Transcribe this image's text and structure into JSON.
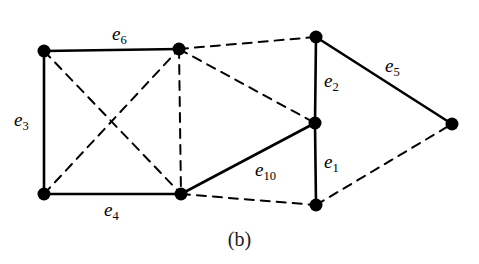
{
  "figure": {
    "caption": "(b)",
    "width": 479,
    "height": 264,
    "background_color": "#ffffff",
    "stroke_color": "#000000",
    "node_color": "#000000"
  },
  "chart_data": {
    "type": "diagram",
    "subtype": "graph-node-link",
    "title": "(b)",
    "node_radius": 6.5,
    "nodes": [
      {
        "id": "v1",
        "name": "top-left",
        "x": 44,
        "y": 51
      },
      {
        "id": "v2",
        "name": "top-middle",
        "x": 179,
        "y": 49
      },
      {
        "id": "v3",
        "name": "top-right",
        "x": 316,
        "y": 37
      },
      {
        "id": "v4",
        "name": "middle-right",
        "x": 315,
        "y": 123
      },
      {
        "id": "v5",
        "name": "far-right",
        "x": 452,
        "y": 124
      },
      {
        "id": "v6",
        "name": "bottom-left",
        "x": 44,
        "y": 194
      },
      {
        "id": "v7",
        "name": "bottom-middle",
        "x": 181,
        "y": 194
      },
      {
        "id": "v8",
        "name": "bottom-right",
        "x": 316,
        "y": 205
      }
    ],
    "edges": [
      {
        "id": "e6",
        "from": "v1",
        "to": "v2",
        "style": "solid",
        "label": "e",
        "sub": "6",
        "label_x": 112,
        "label_y": 24
      },
      {
        "id": "e3",
        "from": "v1",
        "to": "v6",
        "style": "solid",
        "label": "e",
        "sub": "3",
        "label_x": 14,
        "label_y": 110
      },
      {
        "id": "e4",
        "from": "v6",
        "to": "v7",
        "style": "solid",
        "label": "e",
        "sub": "4",
        "label_x": 104,
        "label_y": 200
      },
      {
        "id": "e10",
        "from": "v7",
        "to": "v4",
        "style": "solid",
        "label": "e",
        "sub": "10",
        "label_x": 255,
        "label_y": 160
      },
      {
        "id": "e2",
        "from": "v3",
        "to": "v4",
        "style": "solid",
        "label": "e",
        "sub": "2",
        "label_x": 324,
        "label_y": 71
      },
      {
        "id": "e1",
        "from": "v4",
        "to": "v8",
        "style": "solid",
        "label": "e",
        "sub": "1",
        "label_x": 324,
        "label_y": 152
      },
      {
        "id": "e5",
        "from": "v3",
        "to": "v5",
        "style": "solid",
        "label": "e",
        "sub": "5",
        "label_x": 385,
        "label_y": 56
      },
      {
        "id": "d1",
        "from": "v1",
        "to": "v7",
        "style": "dashed",
        "label": "",
        "sub": ""
      },
      {
        "id": "d2",
        "from": "v6",
        "to": "v2",
        "style": "dashed",
        "label": "",
        "sub": ""
      },
      {
        "id": "d3",
        "from": "v2",
        "to": "v7",
        "style": "dashed",
        "label": "",
        "sub": ""
      },
      {
        "id": "d4",
        "from": "v2",
        "to": "v3",
        "style": "dashed",
        "label": "",
        "sub": ""
      },
      {
        "id": "d5",
        "from": "v2",
        "to": "v4",
        "style": "dashed",
        "label": "",
        "sub": ""
      },
      {
        "id": "d6",
        "from": "v7",
        "to": "v8",
        "style": "dashed",
        "label": "",
        "sub": ""
      },
      {
        "id": "d7",
        "from": "v8",
        "to": "v5",
        "style": "dashed",
        "label": "",
        "sub": ""
      }
    ],
    "legend": [],
    "xlabel": "",
    "ylabel": ""
  }
}
